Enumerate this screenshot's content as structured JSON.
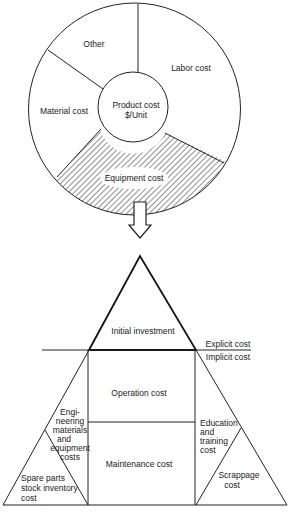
{
  "pie": {
    "center_label_line1": "Product cost",
    "center_label_line2": "$/Unit",
    "segments": [
      {
        "label": "Other"
      },
      {
        "label": "Labor cost"
      },
      {
        "label": "Material cost"
      },
      {
        "label": "Equipment cost",
        "hatched": true
      }
    ]
  },
  "arrow": {
    "direction": "down"
  },
  "pyramid": {
    "top": {
      "label": "Initial investment"
    },
    "divider": {
      "above": "Explicit cost",
      "below": "Implicit cost"
    },
    "center_upper": {
      "label": "Operation cost"
    },
    "center_lower": {
      "label": "Maintenance cost"
    },
    "left_outer": {
      "lines": [
        "Engi-",
        "neering",
        "materials",
        "and",
        "equipment",
        "costs"
      ]
    },
    "left_inner": {
      "lines": [
        "Spare parts",
        "stock inventory",
        "cost"
      ]
    },
    "right_outer": {
      "lines": [
        "Education",
        "and",
        "training",
        "cost"
      ]
    },
    "right_inner": {
      "lines": [
        "Scrappage",
        "cost"
      ]
    }
  },
  "colors": {
    "line": "#222222",
    "background": "#ffffff"
  }
}
